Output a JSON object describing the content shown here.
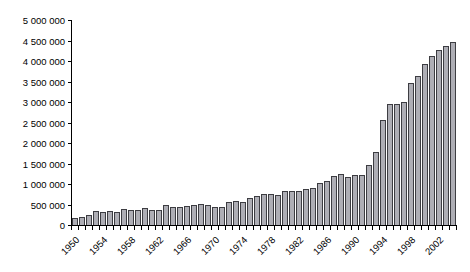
{
  "figure": {
    "background": "#ffffff",
    "width": 470,
    "height": 272
  },
  "chart_data": {
    "type": "bar",
    "title": "",
    "xlabel": "",
    "ylabel": "",
    "legend": "none",
    "grid": "off",
    "categories": [
      1950,
      1951,
      1952,
      1953,
      1954,
      1955,
      1956,
      1957,
      1958,
      1959,
      1960,
      1961,
      1962,
      1963,
      1964,
      1965,
      1966,
      1967,
      1968,
      1969,
      1970,
      1971,
      1972,
      1973,
      1974,
      1975,
      1976,
      1977,
      1978,
      1979,
      1980,
      1981,
      1982,
      1983,
      1984,
      1985,
      1986,
      1987,
      1988,
      1989,
      1990,
      1991,
      1992,
      1993,
      1994,
      1995,
      1996,
      1997,
      1998,
      1999,
      2000,
      2001,
      2002,
      2003,
      2004
    ],
    "values": [
      160000,
      200000,
      250000,
      330000,
      310000,
      330000,
      315000,
      400000,
      360000,
      365000,
      420000,
      375000,
      365000,
      490000,
      440000,
      445000,
      465000,
      490000,
      520000,
      495000,
      450000,
      445000,
      570000,
      580000,
      550000,
      670000,
      700000,
      760000,
      755000,
      740000,
      840000,
      820000,
      825000,
      890000,
      910000,
      1030000,
      1080000,
      1190000,
      1250000,
      1180000,
      1220000,
      1210000,
      1460000,
      1780000,
      2560000,
      2950000,
      2940000,
      3010000,
      3460000,
      3630000,
      3930000,
      4130000,
      4270000,
      4370000,
      4470000
    ],
    "y_axis": {
      "min": 0,
      "max": 5000000,
      "tick_step": 500000,
      "tick_labels": [
        "0",
        "500 000",
        "1 000 000",
        "1 500 000",
        "2 000 000",
        "2 500 000",
        "3 000 000",
        "3 500 000",
        "4 000 000",
        "4 500 000",
        "5 000 000"
      ]
    },
    "x_axis": {
      "tick_every_year": true,
      "labeled_years": [
        1950,
        1954,
        1958,
        1962,
        1966,
        1970,
        1974,
        1978,
        1982,
        1986,
        1990,
        1994,
        1998,
        2002
      ],
      "label_rotation_deg": -45
    },
    "colors": {
      "bar_fill": "#aeaeb5",
      "bar_stroke": "#3d3d42",
      "axis": "#000000",
      "text": "#000000"
    }
  }
}
